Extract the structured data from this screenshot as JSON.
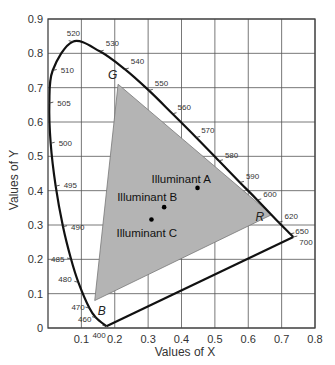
{
  "chart_data": {
    "type": "scatter",
    "title": "",
    "xlabel": "Values of X",
    "ylabel": "Values of Y",
    "xlim": [
      0,
      0.8
    ],
    "ylim": [
      0,
      0.9
    ],
    "grid": true,
    "x_ticks": [
      "0.1",
      "0.2",
      "0.3",
      "0.4",
      "0.5",
      "0.6",
      "0.7",
      "0.8"
    ],
    "y_ticks": [
      "0",
      "0.1",
      "0.2",
      "0.3",
      "0.4",
      "0.5",
      "0.6",
      "0.7",
      "0.8",
      "0.9"
    ],
    "spectral_locus": [
      {
        "nm": "400",
        "x": 0.175,
        "y": 0.005
      },
      {
        "nm": "460",
        "x": 0.144,
        "y": 0.03
      },
      {
        "nm": "470",
        "x": 0.124,
        "y": 0.058
      },
      {
        "nm": "480",
        "x": 0.091,
        "y": 0.133
      },
      {
        "nm": "485",
        "x": 0.069,
        "y": 0.201
      },
      {
        "nm": "490",
        "x": 0.045,
        "y": 0.295
      },
      {
        "nm": "495",
        "x": 0.023,
        "y": 0.413
      },
      {
        "nm": "500",
        "x": 0.008,
        "y": 0.538
      },
      {
        "nm": "505",
        "x": 0.004,
        "y": 0.655
      },
      {
        "nm": "510",
        "x": 0.014,
        "y": 0.75
      },
      {
        "nm": "520",
        "x": 0.074,
        "y": 0.834
      },
      {
        "nm": "530",
        "x": 0.155,
        "y": 0.806
      },
      {
        "nm": "540",
        "x": 0.23,
        "y": 0.754
      },
      {
        "nm": "550",
        "x": 0.302,
        "y": 0.692
      },
      {
        "nm": "560",
        "x": 0.373,
        "y": 0.624
      },
      {
        "nm": "570",
        "x": 0.444,
        "y": 0.555
      },
      {
        "nm": "580",
        "x": 0.512,
        "y": 0.487
      },
      {
        "nm": "590",
        "x": 0.575,
        "y": 0.424
      },
      {
        "nm": "600",
        "x": 0.627,
        "y": 0.373
      },
      {
        "nm": "620",
        "x": 0.691,
        "y": 0.308
      },
      {
        "nm": "650",
        "x": 0.726,
        "y": 0.274
      },
      {
        "nm": "700",
        "x": 0.735,
        "y": 0.265
      }
    ],
    "gamut_triangle": [
      {
        "label": "R",
        "x": 0.67,
        "y": 0.33
      },
      {
        "label": "G",
        "x": 0.21,
        "y": 0.71
      },
      {
        "label": "B",
        "x": 0.14,
        "y": 0.08
      }
    ],
    "illuminants": [
      {
        "label": "Illuminant A",
        "x": 0.448,
        "y": 0.408
      },
      {
        "label": "Illuminant B",
        "x": 0.348,
        "y": 0.352
      },
      {
        "label": "Illuminant C",
        "x": 0.31,
        "y": 0.316
      }
    ],
    "colors": {
      "gamut_fill": "#b4b4b4",
      "locus_stroke": "#111111",
      "grid": "#555555"
    }
  }
}
